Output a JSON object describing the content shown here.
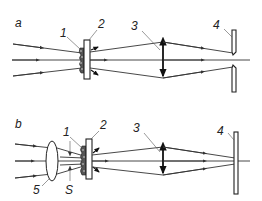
{
  "diagram": {
    "panels": [
      {
        "id": "a",
        "label": "a",
        "callouts": [
          "1",
          "2",
          "3",
          "4"
        ]
      },
      {
        "id": "b",
        "label": "b",
        "callouts": [
          "1",
          "2",
          "3",
          "4",
          "5",
          "S"
        ]
      }
    ],
    "colors": {
      "line": "#333333",
      "background": "#ffffff"
    }
  }
}
